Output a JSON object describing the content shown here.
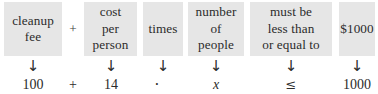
{
  "diagram": {
    "type": "word-phrase-to-expression-translation",
    "top_row": [
      {
        "kind": "box",
        "name": "cleanup-fee",
        "lines": [
          "cleanup",
          "fee"
        ]
      },
      {
        "kind": "operator",
        "name": "plus-operator-top",
        "lines": [
          "+"
        ]
      },
      {
        "kind": "box",
        "name": "cost-per-person",
        "lines": [
          "cost",
          "per",
          "person"
        ]
      },
      {
        "kind": "box",
        "name": "times",
        "lines": [
          "times"
        ]
      },
      {
        "kind": "box",
        "name": "number-of-people",
        "lines": [
          "number",
          "of",
          "people"
        ]
      },
      {
        "kind": "box",
        "name": "must-be-less-than-or-equal-to",
        "lines": [
          "must be",
          "less than",
          "or equal to"
        ]
      },
      {
        "kind": "box",
        "name": "one-thousand-dollars",
        "lines": [
          "$1000"
        ]
      }
    ],
    "arrow_glyph": "↓",
    "arrow_count": 6,
    "bottom_row": [
      {
        "name": "value-cleanup-fee",
        "text": "100",
        "style": "plain"
      },
      {
        "name": "plus-operator",
        "text": "+",
        "style": "plain"
      },
      {
        "name": "value-cost-per-person",
        "text": "14",
        "style": "plain"
      },
      {
        "name": "multiplication-dot",
        "text": "·",
        "style": "dot"
      },
      {
        "name": "variable-x",
        "text": "x",
        "style": "italic"
      },
      {
        "name": "less-than-or-equal-sign",
        "text": "≤",
        "style": "sym"
      },
      {
        "name": "value-one-thousand",
        "text": "1000",
        "style": "plain"
      }
    ],
    "resulting_inequality": "100 + 14 · x ≤ 1000",
    "colors": {
      "page_background": "#ffffff",
      "box_fill": "#e6e6e6",
      "text": "#2b2b2b"
    }
  }
}
